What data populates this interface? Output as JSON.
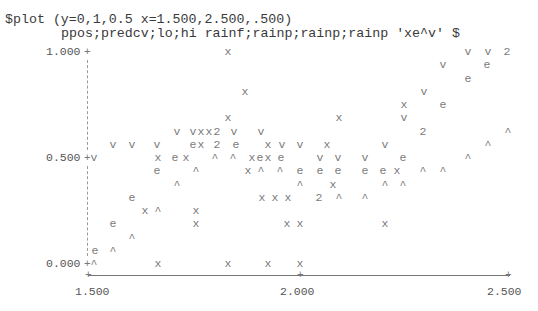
{
  "command": {
    "line1": "$plot (y=0,1,0.5 x=1.500,2.500,.500)",
    "line2": "ppos;predcv;lo;hi rainf;rainp;rainp;rainp 'xe^v' $"
  },
  "y_axis": {
    "labels": [
      "1.000",
      "0.500",
      "0.000"
    ]
  },
  "x_axis": {
    "labels": [
      "1.500",
      "2.000",
      "2.500"
    ]
  },
  "chart_data": {
    "type": "scatter",
    "title": "$plot (y=0,1,0.5 x=1.500,2.500,.500)",
    "subtitle": "ppos;predcv;lo;hi rainf;rainp;rainp;rainp 'xe^v' $",
    "xlabel": "rainf / rainp",
    "ylabel": "ppos; predcv; lo; hi",
    "xlim": [
      1.5,
      2.5
    ],
    "ylim": [
      0,
      1
    ],
    "x_ticks": [
      "1.500",
      "2.000",
      "2.500"
    ],
    "y_ticks": [
      "0.000",
      "0.500",
      "1.000"
    ],
    "grid": false,
    "legend": {
      "x": "ppos",
      "e": "predcv",
      "^": "lo",
      "v": "hi",
      "2": "overlap of two symbols"
    },
    "glyphs": [
      {
        "r": 0,
        "x": 228,
        "c": "x"
      },
      {
        "r": 0,
        "x": 468,
        "c": "v"
      },
      {
        "r": 0,
        "x": 488,
        "c": "v"
      },
      {
        "r": 0,
        "x": 507,
        "c": "2"
      },
      {
        "r": 1,
        "x": 443,
        "c": "v"
      },
      {
        "r": 1,
        "x": 487,
        "c": "e"
      },
      {
        "r": 2,
        "x": 468,
        "c": "e"
      },
      {
        "r": 3,
        "x": 245,
        "c": "x"
      },
      {
        "r": 3,
        "x": 424,
        "c": "v"
      },
      {
        "r": 4,
        "x": 404,
        "c": "x"
      },
      {
        "r": 4,
        "x": 443,
        "c": "e"
      },
      {
        "r": 5,
        "x": 228,
        "c": "x"
      },
      {
        "r": 5,
        "x": 339,
        "c": "x"
      },
      {
        "r": 5,
        "x": 404,
        "c": "v"
      },
      {
        "r": 6,
        "x": 177,
        "c": "v"
      },
      {
        "r": 6,
        "x": 193,
        "c": "v"
      },
      {
        "r": 6,
        "x": 201,
        "c": "x"
      },
      {
        "r": 6,
        "x": 209,
        "c": "x"
      },
      {
        "r": 6,
        "x": 217,
        "c": "2"
      },
      {
        "r": 6,
        "x": 234,
        "c": "v"
      },
      {
        "r": 6,
        "x": 261,
        "c": "v"
      },
      {
        "r": 6,
        "x": 423,
        "c": "2"
      },
      {
        "r": 6,
        "x": 508,
        "c": "^"
      },
      {
        "r": 7,
        "x": 113,
        "c": "v"
      },
      {
        "r": 7,
        "x": 132,
        "c": "v"
      },
      {
        "r": 7,
        "x": 157,
        "c": "v"
      },
      {
        "r": 7,
        "x": 193,
        "c": "e"
      },
      {
        "r": 7,
        "x": 201,
        "c": "x"
      },
      {
        "r": 7,
        "x": 217,
        "c": "2"
      },
      {
        "r": 7,
        "x": 236,
        "c": "e"
      },
      {
        "r": 7,
        "x": 268,
        "c": "x"
      },
      {
        "r": 7,
        "x": 282,
        "c": "v"
      },
      {
        "r": 7,
        "x": 300,
        "c": "v"
      },
      {
        "r": 7,
        "x": 327,
        "c": "x"
      },
      {
        "r": 7,
        "x": 385,
        "c": "v"
      },
      {
        "r": 7,
        "x": 488,
        "c": "^"
      },
      {
        "r": 8,
        "x": 94,
        "c": "v"
      },
      {
        "r": 8,
        "x": 158,
        "c": "x"
      },
      {
        "r": 8,
        "x": 175,
        "c": "e"
      },
      {
        "r": 8,
        "x": 186,
        "c": "x"
      },
      {
        "r": 8,
        "x": 215,
        "c": "^"
      },
      {
        "r": 8,
        "x": 233,
        "c": "^"
      },
      {
        "r": 8,
        "x": 252,
        "c": "x"
      },
      {
        "r": 8,
        "x": 260,
        "c": "e"
      },
      {
        "r": 8,
        "x": 268,
        "c": "x"
      },
      {
        "r": 8,
        "x": 281,
        "c": "e"
      },
      {
        "r": 8,
        "x": 320,
        "c": "v"
      },
      {
        "r": 8,
        "x": 338,
        "c": "v"
      },
      {
        "r": 8,
        "x": 365,
        "c": "v"
      },
      {
        "r": 8,
        "x": 403,
        "c": "e"
      },
      {
        "r": 8,
        "x": 468,
        "c": "^"
      },
      {
        "r": 9,
        "x": 157,
        "c": "e"
      },
      {
        "r": 9,
        "x": 196,
        "c": "^"
      },
      {
        "r": 9,
        "x": 248,
        "c": "x"
      },
      {
        "r": 9,
        "x": 261,
        "c": "^"
      },
      {
        "r": 9,
        "x": 280,
        "c": "^"
      },
      {
        "r": 9,
        "x": 300,
        "c": "e"
      },
      {
        "r": 9,
        "x": 320,
        "c": "e"
      },
      {
        "r": 9,
        "x": 338,
        "c": "e"
      },
      {
        "r": 9,
        "x": 365,
        "c": "e"
      },
      {
        "r": 9,
        "x": 383,
        "c": "e"
      },
      {
        "r": 9,
        "x": 397,
        "c": "x"
      },
      {
        "r": 9,
        "x": 423,
        "c": "^"
      },
      {
        "r": 9,
        "x": 443,
        "c": "^"
      },
      {
        "r": 10,
        "x": 177,
        "c": "^"
      },
      {
        "r": 10,
        "x": 300,
        "c": "^"
      },
      {
        "r": 10,
        "x": 333,
        "c": "x"
      },
      {
        "r": 10,
        "x": 385,
        "c": "^"
      },
      {
        "r": 10,
        "x": 403,
        "c": "^"
      },
      {
        "r": 11,
        "x": 132,
        "c": "e"
      },
      {
        "r": 11,
        "x": 262,
        "c": "x"
      },
      {
        "r": 11,
        "x": 275,
        "c": "x"
      },
      {
        "r": 11,
        "x": 288,
        "c": "x"
      },
      {
        "r": 11,
        "x": 319,
        "c": "2"
      },
      {
        "r": 11,
        "x": 339,
        "c": "^"
      },
      {
        "r": 11,
        "x": 365,
        "c": "^"
      },
      {
        "r": 12,
        "x": 145,
        "c": "x"
      },
      {
        "r": 12,
        "x": 158,
        "c": "^"
      },
      {
        "r": 12,
        "x": 196,
        "c": "x"
      },
      {
        "r": 13,
        "x": 113,
        "c": "e"
      },
      {
        "r": 13,
        "x": 196,
        "c": "x"
      },
      {
        "r": 13,
        "x": 287,
        "c": "x"
      },
      {
        "r": 13,
        "x": 300,
        "c": "x"
      },
      {
        "r": 13,
        "x": 385,
        "c": "x"
      },
      {
        "r": 14,
        "x": 132,
        "c": "^"
      },
      {
        "r": 15,
        "x": 95,
        "c": "e"
      },
      {
        "r": 15,
        "x": 113,
        "c": "^"
      },
      {
        "r": 16,
        "x": 94,
        "c": "^"
      },
      {
        "r": 16,
        "x": 158,
        "c": "x"
      },
      {
        "r": 16,
        "x": 228,
        "c": "x"
      },
      {
        "r": 16,
        "x": 268,
        "c": "x"
      },
      {
        "r": 16,
        "x": 300,
        "c": "x"
      }
    ]
  }
}
